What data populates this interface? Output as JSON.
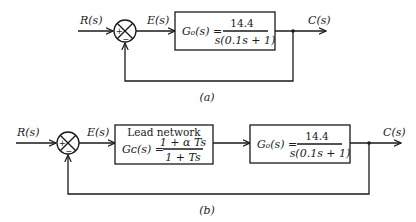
{
  "diagram_a": {
    "caption": "(a)",
    "input_label": "R(s)",
    "error_label": "E(s)",
    "output_label": "C(s)",
    "sum_plus": "+",
    "sum_minus": "−",
    "plant": {
      "lhs": "G₀(s) =",
      "numerator": "14.4",
      "denominator": "s(0.1s + 1)"
    }
  },
  "diagram_b": {
    "caption": "(b)",
    "input_label": "R(s)",
    "error_label": "E(s)",
    "output_label": "C(s)",
    "sum_plus": "+",
    "sum_minus": "−",
    "compensator": {
      "title": "Lead network",
      "lhs": "Gᴄ(s) =",
      "numerator": "1 + α Ts",
      "denominator": "1 + Ts"
    },
    "plant": {
      "lhs": "G₀(s) =",
      "numerator": "14.4",
      "denominator": "s(0.1s + 1)"
    }
  }
}
